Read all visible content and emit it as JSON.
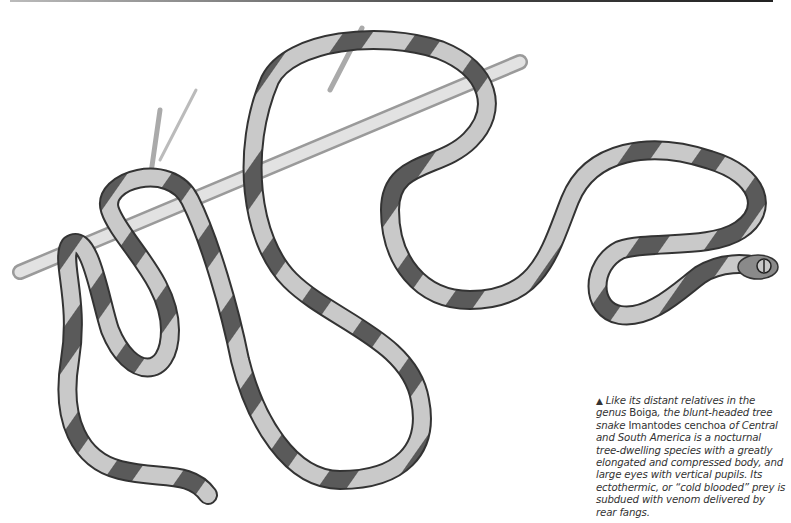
{
  "illustration": {
    "subject": "blunt-headed tree snake on branch",
    "colors": {
      "band_dark": "#555555",
      "band_light": "#c8c8c8",
      "branch": "#d6d6d6",
      "outline": "#333333"
    }
  },
  "caption": {
    "marker": "▲",
    "segments": [
      {
        "text": "Like its distant relatives in the genus ",
        "italic": true
      },
      {
        "text": "Boiga",
        "italic": false
      },
      {
        "text": ", the blunt-headed tree snake ",
        "italic": true
      },
      {
        "text": "Imantodes cenchoa",
        "italic": false
      },
      {
        "text": " of Central and South America is a nocturnal tree-dwelling species with a greatly elongated and compressed body, and large eyes with vertical pupils. Its ectothermic, or “cold blooded” prey is subdued with venom delivered by rear fangs.",
        "italic": true
      }
    ]
  }
}
